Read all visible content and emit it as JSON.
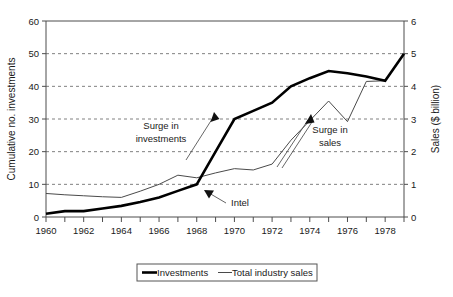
{
  "chart_data": {
    "type": "line",
    "title": "",
    "xlabel": "",
    "ylabel": "Cumulative no. investments",
    "y2label": "Sales ($ billion)",
    "xlim": [
      1960,
      1979
    ],
    "ylim": [
      0,
      60
    ],
    "y2lim": [
      0,
      6
    ],
    "grid": true,
    "legend_position": "bottom",
    "x_ticks": [
      "1960",
      "1962",
      "1964",
      "1966",
      "1968",
      "1970",
      "1972",
      "1974",
      "1976",
      "1978"
    ],
    "x_tick_values": [
      1960,
      1962,
      1964,
      1966,
      1968,
      1970,
      1972,
      1974,
      1976,
      1978
    ],
    "x_minor_tick_values": [
      1961,
      1963,
      1965,
      1967,
      1969,
      1971,
      1973,
      1975,
      1977,
      1979
    ],
    "y_ticks": [
      "0",
      "10",
      "20",
      "30",
      "40",
      "50",
      "60"
    ],
    "y_tick_values": [
      0,
      10,
      20,
      30,
      40,
      50,
      60
    ],
    "y2_ticks": [
      "0",
      "1",
      "2",
      "3",
      "4",
      "5",
      "6"
    ],
    "y2_tick_values": [
      0,
      1,
      2,
      3,
      4,
      5,
      6
    ],
    "x": [
      1960,
      1961,
      1962,
      1963,
      1964,
      1965,
      1966,
      1967,
      1968,
      1969,
      1970,
      1971,
      1972,
      1973,
      1974,
      1975,
      1976,
      1977,
      1978,
      1979
    ],
    "series": [
      {
        "name": "Investments",
        "axis": "left",
        "style": "thick-black",
        "values": [
          1,
          1.8,
          1.8,
          2.6,
          3.4,
          4.6,
          6,
          8,
          10,
          20,
          30,
          32.5,
          35,
          40,
          42.5,
          44.7,
          44,
          43,
          41.7,
          50
        ]
      },
      {
        "name": "Total industry sales",
        "axis": "right",
        "style": "thin-gray",
        "values": [
          0.72,
          0.68,
          0.65,
          0.62,
          0.6,
          0.79,
          1.0,
          1.28,
          1.2,
          1.35,
          1.48,
          1.44,
          1.62,
          2.35,
          2.95,
          3.55,
          2.92,
          4.15,
          4.17,
          5.0
        ]
      }
    ],
    "annotations": [
      {
        "name": "surge-in-investments",
        "line1": "Surge in",
        "line2": "investments",
        "arrow": "thin-up-right"
      },
      {
        "name": "surge-in-sales",
        "line1": "Surge in",
        "line2": "sales",
        "arrow": "double-thin-up-right"
      },
      {
        "name": "intel",
        "line1": "Intel",
        "line2": "",
        "arrow": "thin-up-left"
      }
    ],
    "legend": [
      {
        "label": "Investments",
        "style": "thick-black"
      },
      {
        "label": "Total industry sales",
        "style": "thin-gray"
      }
    ],
    "colors": {
      "investments": "#000000",
      "sales": "#4a4a4a",
      "grid": "#808080",
      "axis": "#4d4d4d",
      "text": "#1a1a1a",
      "background": "#ffffff"
    }
  }
}
